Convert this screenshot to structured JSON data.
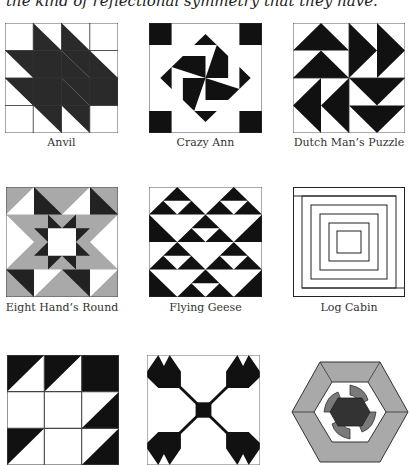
{
  "intro_text": "the kind of reflectional symmetry that they have.",
  "colors": {
    "dark": "#1a1a1a",
    "gray": "#a9a9a9",
    "mid": "#6f6f6f",
    "darkgray": "#333333",
    "outline": "#444444",
    "light": "#ffffff"
  },
  "blocks": [
    {
      "name": "Anvil"
    },
    {
      "name": "Crazy Ann"
    },
    {
      "name": "Dutch Man’s Puzzle"
    },
    {
      "name": "Eight Hand’s Round"
    },
    {
      "name": "Flying Geese"
    },
    {
      "name": "Log Cabin"
    },
    {
      "name": ""
    },
    {
      "name": ""
    },
    {
      "name": ""
    }
  ]
}
